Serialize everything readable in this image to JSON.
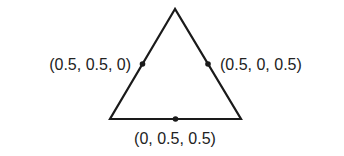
{
  "diagram": {
    "type": "simplex-triangle",
    "stroke_color": "#1a1a1a",
    "vertices": {
      "top": [
        175,
        9
      ],
      "bottom_left": [
        110,
        119
      ],
      "bottom_right": [
        241,
        119
      ]
    },
    "points": [
      {
        "name": "left-edge-midpoint",
        "x": 142.5,
        "y": 64,
        "label": "(0.5, 0.5, 0)"
      },
      {
        "name": "right-edge-midpoint",
        "x": 208,
        "y": 64,
        "label": "(0.5, 0, 0.5)"
      },
      {
        "name": "bottom-edge-midpoint",
        "x": 175.5,
        "y": 119,
        "label": "(0, 0.5, 0.5)"
      }
    ]
  }
}
